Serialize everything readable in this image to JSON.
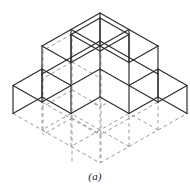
{
  "figure": {
    "caption": "(a)",
    "kind": "isometric-cube-stack",
    "background_color": "#ffffff",
    "visible_edge_color": "#2b2b2b",
    "hidden_edge_color": "#9a9a9a",
    "face_fill_color": "#ffffff"
  },
  "projection": {
    "origin_x": 100,
    "origin_y": 163,
    "unit_dx": 29,
    "unit_dy": 16.5,
    "unit_dz": 28
  },
  "chart_data": {
    "type": "scatter",
    "title": "(a)",
    "xlabel": "",
    "ylabel": "",
    "grid": false,
    "legend": "none",
    "cubes": [
      {
        "x": 0,
        "y": 0,
        "z": 0
      },
      {
        "x": 1,
        "y": 0,
        "z": 0
      },
      {
        "x": 0,
        "y": 1,
        "z": 0
      },
      {
        "x": 1,
        "y": 1,
        "z": 0
      },
      {
        "x": 0,
        "y": 2,
        "z": 0
      },
      {
        "x": 2,
        "y": 0,
        "z": 0
      },
      {
        "x": 0,
        "y": 0,
        "z": 1
      },
      {
        "x": 1,
        "y": 0,
        "z": 1
      },
      {
        "x": 0,
        "y": 1,
        "z": 1
      },
      {
        "x": 1,
        "y": 1,
        "z": 1
      },
      {
        "x": 0,
        "y": 0,
        "z": 2
      },
      {
        "x": 1,
        "y": 0,
        "z": 2
      },
      {
        "x": 0,
        "y": 1,
        "z": 2
      },
      {
        "x": 1,
        "y": 1,
        "z": 2
      },
      {
        "x": 0,
        "y": 0,
        "z": 3
      }
    ],
    "cube_count": 15,
    "levels": [
      {
        "level": 0,
        "count": 6
      },
      {
        "level": 1,
        "count": 4
      },
      {
        "level": 2,
        "count": 4
      },
      {
        "level": 3,
        "count": 1
      }
    ]
  },
  "geometry": {
    "visible_edges": [
      [
        72,
        6,
        101,
        22.5
      ],
      [
        101,
        22.5,
        101,
        50.5
      ],
      [
        101,
        50.5,
        72,
        34
      ],
      [
        72,
        34,
        72,
        6
      ],
      [
        43,
        22.5,
        72,
        6
      ],
      [
        43,
        22.5,
        43,
        50.5
      ],
      [
        43,
        50.5,
        72,
        67
      ],
      [
        72,
        67,
        101,
        50.5
      ],
      [
        72,
        34,
        72,
        67
      ],
      [
        43,
        50.5,
        14,
        67
      ],
      [
        14,
        67,
        14,
        95
      ],
      [
        14,
        95,
        43,
        111.5
      ],
      [
        43,
        111.5,
        72,
        95
      ],
      [
        72,
        95,
        72,
        67
      ],
      [
        101,
        50.5,
        130,
        67
      ],
      [
        130,
        67,
        130,
        95
      ],
      [
        130,
        95,
        101,
        111.5
      ],
      [
        43,
        111.5,
        43,
        139.5
      ],
      [
        43,
        139.5,
        72,
        156
      ],
      [
        72,
        156,
        101,
        139.5
      ],
      [
        101,
        139.5,
        101,
        111.5
      ],
      [
        72,
        95,
        72,
        123
      ],
      [
        72,
        123,
        43,
        139.5
      ],
      [
        72,
        123,
        101,
        139.5
      ],
      [
        14,
        95,
        14,
        123
      ],
      [
        8,
        118,
        37,
        101.5
      ],
      [
        8,
        118,
        8,
        146
      ],
      [
        8,
        146,
        37,
        162.5
      ],
      [
        37,
        162.5,
        66,
        146
      ],
      [
        66,
        146,
        66,
        118
      ],
      [
        66,
        118,
        37,
        101.5
      ],
      [
        37,
        101.5,
        37,
        129.5
      ],
      [
        37,
        129.5,
        8,
        146
      ],
      [
        37,
        129.5,
        66,
        146
      ],
      [
        101,
        111.5,
        130,
        95
      ],
      [
        130,
        95,
        159,
        111.5
      ],
      [
        159,
        111.5,
        159,
        139.5
      ],
      [
        159,
        139.5,
        130,
        156
      ],
      [
        130,
        156,
        101,
        139.5
      ],
      [
        130,
        156,
        130,
        128
      ],
      [
        130,
        128,
        101,
        111.5
      ],
      [
        130,
        128,
        159,
        111.5
      ],
      [
        72,
        156,
        72,
        163
      ],
      [
        101,
        139.5,
        101,
        163
      ],
      [
        72,
        163,
        101,
        163
      ]
    ],
    "hidden_edges": [
      [
        72,
        34,
        43,
        50.5
      ],
      [
        43,
        50.5,
        43,
        78.5
      ],
      [
        72,
        62,
        43,
        78.5
      ],
      [
        72,
        62,
        72,
        34
      ],
      [
        72,
        62,
        101,
        78.5
      ],
      [
        101,
        78.5,
        101,
        50.5
      ],
      [
        43,
        78.5,
        43,
        106.5
      ],
      [
        72,
        90,
        43,
        106.5
      ],
      [
        72,
        90,
        72,
        62
      ],
      [
        72,
        90,
        101,
        106.5
      ],
      [
        101,
        106.5,
        101,
        78.5
      ],
      [
        43,
        106.5,
        43,
        134.5
      ],
      [
        72,
        118,
        43,
        134.5
      ],
      [
        72,
        118,
        72,
        90
      ],
      [
        72,
        118,
        101,
        134.5
      ],
      [
        101,
        134.5,
        101,
        106.5
      ],
      [
        101,
        134.5,
        101,
        162
      ],
      [
        72,
        118,
        72,
        162
      ]
    ]
  }
}
